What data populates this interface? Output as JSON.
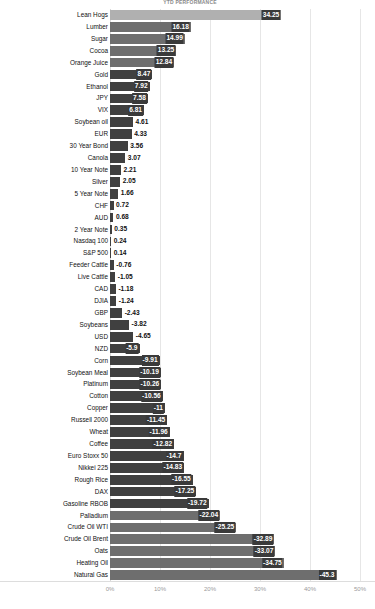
{
  "chart": {
    "title": "YTD PERFORMANCE"
  },
  "axis": {
    "ticks": [
      "0%",
      "10%",
      "20%",
      "30%",
      "40%",
      "50%"
    ],
    "tick_values": [
      0,
      10,
      20,
      30,
      40,
      50
    ]
  },
  "chart_data": {
    "type": "bar",
    "orientation": "horizontal",
    "title": "YTD PERFORMANCE",
    "xlabel": "",
    "ylabel": "",
    "xlim": [
      -50,
      50
    ],
    "grid": true,
    "legend": "none",
    "categories": [
      "Lean Hogs",
      "Lumber",
      "Sugar",
      "Cocoa",
      "Orange Juice",
      "Gold",
      "Ethanol",
      "JPY",
      "VIX",
      "Soybean oil",
      "EUR",
      "30 Year Bond",
      "Canola",
      "10 Year Note",
      "Silver",
      "5 Year Note",
      "CHF",
      "AUD",
      "2 Year Note",
      "Nasdaq 100",
      "S&P 500",
      "Feeder Cattle",
      "Live Cattle",
      "CAD",
      "DJIA",
      "GBP",
      "Soybeans",
      "USD",
      "NZD",
      "Corn",
      "Soybean Meal",
      "Platinum",
      "Cotton",
      "Copper",
      "Russell 2000",
      "Wheat",
      "Coffee",
      "Euro Stoxx 50",
      "Nikkei 225",
      "Rough Rice",
      "DAX",
      "Gasoline RBOB",
      "Palladium",
      "Crude Oil WTI",
      "Crude Oil Brent",
      "Oats",
      "Heating Oil",
      "Natural Gas"
    ],
    "values": [
      34.25,
      16.18,
      14.99,
      13.25,
      12.84,
      8.47,
      7.92,
      7.58,
      6.81,
      4.61,
      4.33,
      3.56,
      3.07,
      2.21,
      2.05,
      1.66,
      0.72,
      0.68,
      0.35,
      0.24,
      0.14,
      -0.76,
      -1.05,
      -1.18,
      -1.24,
      -2.43,
      -3.82,
      -4.65,
      -5.9,
      -9.91,
      -10.19,
      -10.26,
      -10.56,
      -11,
      -11.45,
      -11.96,
      -12.82,
      -14.7,
      -14.83,
      -16.55,
      -17.25,
      -19.72,
      -22.04,
      -25.25,
      -32.89,
      -33.07,
      -34.75,
      -45.3
    ],
    "value_labels": [
      "34.25",
      "16.18",
      "14.99",
      "13.25",
      "12.84",
      "8.47",
      "7.92",
      "7.58",
      "6.81",
      "4.61",
      "4.33",
      "3.56",
      "3.07",
      "2.21",
      "2.05",
      "1.66",
      "0.72",
      "0.68",
      "0.35",
      "0.24",
      "0.14",
      "-0.76",
      "-1.05",
      "-1.18",
      "-1.24",
      "-2.43",
      "-3.82",
      "-4.65",
      "-5.9",
      "-9.91",
      "-10.19",
      "-10.26",
      "-10.56",
      "-11",
      "-11.45",
      "-11.96",
      "-12.82",
      "-14.7",
      "-14.83",
      "-16.55",
      "-17.25",
      "-19.72",
      "-22.04",
      "-25.25",
      "-32.89",
      "-33.07",
      "-34.75",
      "-45.3"
    ]
  },
  "colors": {
    "bar_light": "#b0b0b0",
    "bar_mid": "#808080",
    "bar_dark": "#404040",
    "grid": "#e6e6e6",
    "text": "#111111",
    "axis_text": "#9a9a9a"
  }
}
